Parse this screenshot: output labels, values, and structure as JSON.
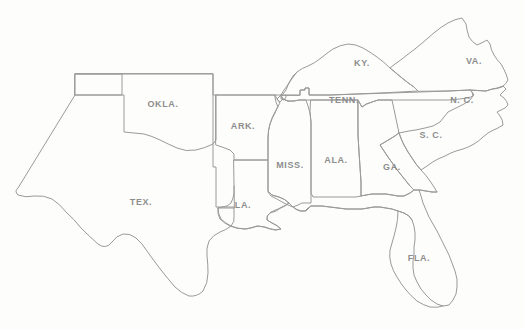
{
  "map": {
    "title": "Southern United States outline map",
    "style": {
      "background_color": "#fdfdfc",
      "border_color": "#9a9a9a",
      "label_color": "#8d8d8d",
      "stroke_width": 1
    },
    "width": 524,
    "height": 329,
    "states": [
      {
        "id": "oklahoma",
        "label": "OKLA.",
        "label_x": 163,
        "label_y": 104
      },
      {
        "id": "arkansas",
        "label": "ARK.",
        "label_x": 243,
        "label_y": 126
      },
      {
        "id": "texas",
        "label": "TEX.",
        "label_x": 141,
        "label_y": 202
      },
      {
        "id": "louisiana",
        "label": "LA.",
        "label_x": 243,
        "label_y": 205
      },
      {
        "id": "mississippi",
        "label": "MISS.",
        "label_x": 290,
        "label_y": 165
      },
      {
        "id": "alabama",
        "label": "ALA.",
        "label_x": 336,
        "label_y": 160
      },
      {
        "id": "tennessee",
        "label": "TENN.",
        "label_x": 344,
        "label_y": 100
      },
      {
        "id": "kentucky",
        "label": "KY.",
        "label_x": 362,
        "label_y": 63
      },
      {
        "id": "virginia",
        "label": "VA.",
        "label_x": 474,
        "label_y": 61
      },
      {
        "id": "north-carolina",
        "label": "N. C.",
        "label_x": 462,
        "label_y": 100
      },
      {
        "id": "south-carolina",
        "label": "S. C.",
        "label_x": 431,
        "label_y": 135
      },
      {
        "id": "georgia",
        "label": "GA.",
        "label_x": 392,
        "label_y": 167
      },
      {
        "id": "florida",
        "label": "FLA.",
        "label_x": 419,
        "label_y": 258
      }
    ]
  }
}
